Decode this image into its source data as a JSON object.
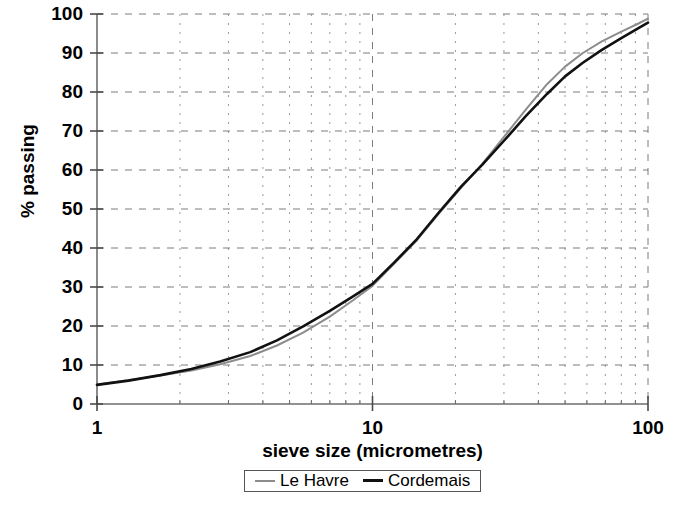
{
  "chart_data": {
    "type": "line",
    "title": "",
    "xlabel": "sieve size (micrometres)",
    "ylabel": "% passing",
    "xscale": "log",
    "xlim": [
      1,
      100
    ],
    "ylim": [
      0,
      100
    ],
    "grid": true,
    "grid_style": "dashed",
    "legend_position": "bottom-center",
    "xticks": [
      1,
      10,
      100
    ],
    "xtick_labels": [
      "1",
      "10",
      "100"
    ],
    "yticks": [
      0,
      10,
      20,
      30,
      40,
      50,
      60,
      70,
      80,
      90,
      100
    ],
    "ytick_labels": [
      "0",
      "10",
      "20",
      "30",
      "40",
      "50",
      "60",
      "70",
      "80",
      "90",
      "100"
    ],
    "minor_x_decade_multipliers": [
      2,
      3,
      4,
      5,
      6,
      7,
      8,
      9
    ],
    "series": [
      {
        "name": "Le Havre",
        "color": "#8c8c8c",
        "linewidth": 2,
        "x": [
          1.0,
          1.3,
          1.7,
          2.2,
          2.8,
          3.6,
          4.5,
          5.6,
          7.0,
          8.5,
          10.0,
          12.0,
          14.5,
          17.5,
          21.0,
          25.0,
          30.0,
          36.0,
          43.0,
          50.0,
          58.0,
          68.0,
          80.0,
          92.0,
          100.0
        ],
        "y": [
          5.0,
          6.1,
          7.3,
          8.6,
          10.2,
          12.3,
          15.0,
          18.3,
          22.4,
          26.6,
          30.3,
          36.0,
          42.0,
          49.0,
          55.5,
          61.5,
          68.5,
          75.5,
          82.0,
          86.5,
          90.0,
          93.0,
          95.5,
          97.5,
          98.8
        ]
      },
      {
        "name": "Cordemais",
        "color": "#111111",
        "linewidth": 2.6,
        "x": [
          1.0,
          1.3,
          1.7,
          2.2,
          2.8,
          3.6,
          4.5,
          5.6,
          7.0,
          8.5,
          10.0,
          12.0,
          14.5,
          17.5,
          21.0,
          25.0,
          30.0,
          36.0,
          43.0,
          50.0,
          58.0,
          68.0,
          80.0,
          92.0,
          100.0
        ],
        "y": [
          4.9,
          6.0,
          7.4,
          9.0,
          10.9,
          13.3,
          16.3,
          19.9,
          23.9,
          27.6,
          30.8,
          36.3,
          42.3,
          49.3,
          55.8,
          61.3,
          67.5,
          73.8,
          79.5,
          84.0,
          87.5,
          90.8,
          93.8,
          96.3,
          97.8
        ]
      }
    ],
    "annotations": []
  },
  "legend": {
    "items": [
      {
        "label": "Le Havre",
        "color": "#8c8c8c",
        "linewidth": 2
      },
      {
        "label": "Cordemais",
        "color": "#111111",
        "linewidth": 3
      }
    ]
  },
  "axes": {
    "x_title": "sieve size (micrometres)",
    "y_title": "% passing"
  }
}
